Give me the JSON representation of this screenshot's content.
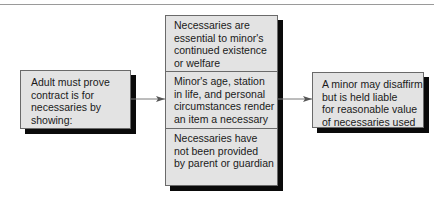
{
  "diagram": {
    "left_box": {
      "lines": [
        "Adult must prove",
        "contract is for",
        "necessaries by",
        "showing:"
      ]
    },
    "middle_box": {
      "cells": [
        {
          "lines": [
            "Necessaries are",
            "essential to minor's",
            "continued existence",
            "or welfare"
          ]
        },
        {
          "lines": [
            "Minor's age, station",
            "in life, and personal",
            "circumstances render",
            "an item a necessary"
          ]
        },
        {
          "lines": [
            "Necessaries have",
            "not been provided",
            "by parent or guardian"
          ]
        }
      ]
    },
    "right_box": {
      "lines": [
        "A minor may disaffirm",
        "but is held liable",
        "for reasonable value",
        "of necessaries used"
      ]
    },
    "colors": {
      "box_fill": "#e3e3e3",
      "shadow": "#0a0a0a",
      "arrow": "#7a7a7a"
    }
  }
}
